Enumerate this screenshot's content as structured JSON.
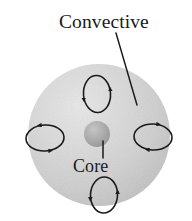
{
  "figure": {
    "type": "star-interior-diagram",
    "background_color": "#ffffff",
    "labels": {
      "convective": "Convective",
      "core": "Core"
    },
    "shapes": {
      "star_body": {
        "name": "convective-zone-sphere",
        "center_x": 99,
        "center_y": 135,
        "radius": 71,
        "fill_light": "#e2e2e2",
        "fill_mid": "#d2d2d2",
        "fill_dark": "#bcbcbc"
      },
      "core": {
        "name": "core-circle",
        "center_x": 97,
        "center_y": 134,
        "radius": 13,
        "fill_light": "#bdbdbd",
        "fill_dark": "#9a9a9a"
      },
      "leader_line_convective": {
        "x1": 116,
        "y1": 33,
        "x2": 137,
        "y2": 105,
        "stroke": "#1a1a1a",
        "width": 1.4
      },
      "leader_line_core": {
        "x1": 103,
        "y1": 141,
        "x2": 103,
        "y2": 158,
        "stroke": "#1a1a1a",
        "width": 1.4
      }
    },
    "convection_cells": [
      {
        "name": "convection-cell-top",
        "orientation": "vertical",
        "center_x": 97,
        "center_y": 94,
        "radius_x": 13.5,
        "radius_y": 18.5,
        "rotation": -4,
        "circulation": "counterclockwise"
      },
      {
        "name": "convection-cell-left",
        "orientation": "horizontal",
        "center_x": 45,
        "center_y": 138,
        "radius_x": 19,
        "radius_y": 13,
        "rotation": -3,
        "circulation": "clockwise"
      },
      {
        "name": "convection-cell-right",
        "orientation": "horizontal",
        "center_x": 153,
        "center_y": 137,
        "radius_x": 19,
        "radius_y": 13,
        "rotation": 3,
        "circulation": "clockwise"
      },
      {
        "name": "convection-cell-bottom",
        "orientation": "vertical",
        "center_x": 104,
        "center_y": 195,
        "radius_x": 13.5,
        "radius_y": 18,
        "rotation": 3,
        "circulation": "counterclockwise"
      }
    ],
    "stroke_color": "#1a1a1a"
  }
}
